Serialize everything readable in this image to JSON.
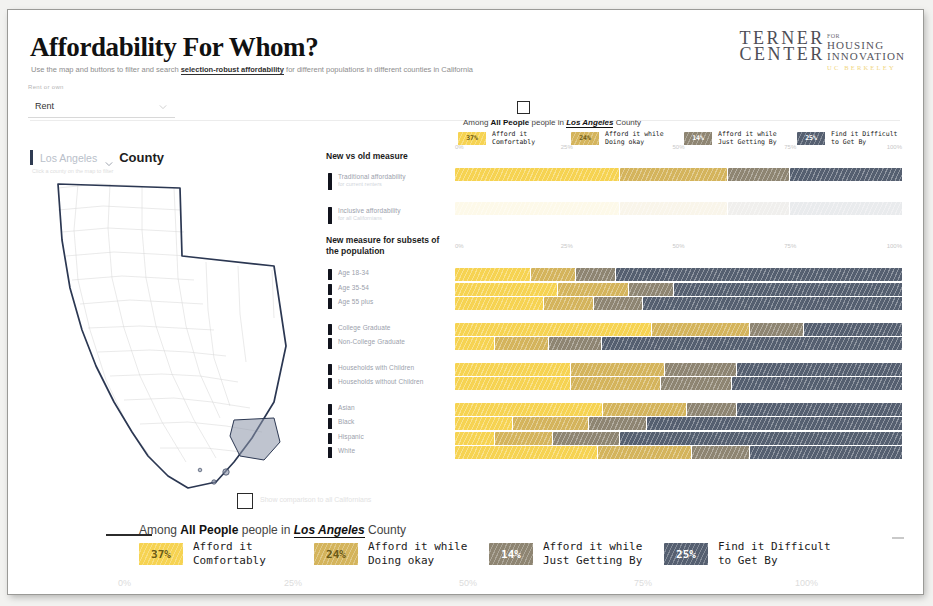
{
  "header": {
    "title": "Affordability For Whom?",
    "subtitle_pre": "Use the map and buttons to filter and search ",
    "subtitle_link": "selection-robust affordability",
    "subtitle_post": " for different populations in different counties in California",
    "logo": {
      "line1": "TERNER",
      "line2": "CENTER",
      "for": "FOR",
      "housing": "HOUSING",
      "innovation": "INNOVATION",
      "uc": "UC BERKELEY"
    }
  },
  "tenure_control": {
    "label": "Rent or own",
    "value": "Rent",
    "chevron": "chevron-down-icon"
  },
  "map": {
    "county_value": "Los Angeles",
    "county_suffix": "County",
    "chevron": "chevron-down-icon",
    "hint": "Click a county on the map to filter",
    "selected": "Los Angeles"
  },
  "controls": {
    "group1_title": "New vs old measure",
    "group1_items": [
      {
        "label": "Traditional affordability",
        "sub": "for current renters"
      },
      {
        "label": "Inclusive affordability",
        "sub": "for all Californians"
      }
    ],
    "group2_title": "New measure for subsets of the population",
    "group2_items": [
      {
        "label": "Age 18-34"
      },
      {
        "label": "Age 35-54"
      },
      {
        "label": "Age 55 plus"
      },
      {
        "label": "College Graduate"
      },
      {
        "label": "Non-College Graduate"
      },
      {
        "label": "Households with Children"
      },
      {
        "label": "Households without Children"
      },
      {
        "label": "Asian"
      },
      {
        "label": "Black"
      },
      {
        "label": "Hispanic"
      },
      {
        "label": "White"
      }
    ]
  },
  "legend": {
    "title_pre": "Among ",
    "title_bold": "All People",
    "title_mid": " people in ",
    "title_italic": "Los Angeles",
    "title_post": " County",
    "items": [
      {
        "pct": "37%",
        "line1": "Afford it",
        "line2": "Comfortably",
        "color": "#f6d352"
      },
      {
        "pct": "24%",
        "line1": "Afford it while",
        "line2": "Doing okay",
        "color": "#d4b45c"
      },
      {
        "pct": "14%",
        "line1": "Afford it while",
        "line2": "Just Getting By",
        "color": "#8e8572"
      },
      {
        "pct": "25%",
        "line1": "Find it Difficult",
        "line2": "to Get By",
        "color": "#555f70"
      }
    ]
  },
  "checkbox_top": {
    "name": "top-checkbox",
    "checked": false
  },
  "checkbox_bottom": {
    "name": "bottom-checkbox",
    "checked": false,
    "note": "Show comparison to all Californians"
  },
  "chart_data": {
    "type": "bar",
    "orientation": "horizontal",
    "stacked": true,
    "title": "Among All People people in Los Angeles County",
    "xlabel": "",
    "ylabel": "",
    "xlim": [
      0,
      100
    ],
    "xticks": [
      "0%",
      "25%",
      "50%",
      "75%",
      "100%"
    ],
    "xtick_values": [
      0,
      25,
      50,
      75,
      100
    ],
    "grid": false,
    "legend_position": "top",
    "series": [
      {
        "name": "Afford it Comfortably",
        "color": "#f6d352"
      },
      {
        "name": "Afford it while Doing okay",
        "color": "#d4b45c"
      },
      {
        "name": "Afford it while Just Getting By",
        "color": "#8e8572"
      },
      {
        "name": "Find it Difficult to Get By",
        "color": "#555f70"
      }
    ],
    "panels": [
      {
        "name": "New vs old measure",
        "categories": [
          "Traditional affordability",
          "Inclusive affordability"
        ],
        "values": [
          [
            37,
            24,
            14,
            25
          ],
          [
            37,
            24,
            14,
            25
          ]
        ],
        "faded": [
          false,
          true
        ]
      },
      {
        "name": "New measure for subsets of the population",
        "categories": [
          "Age 18-34",
          "Age 35-54",
          "Age 55 plus",
          "College Graduate",
          "Non-College Graduate",
          "Households with Children",
          "Households without Children",
          "Asian",
          "Black",
          "Hispanic",
          "White"
        ],
        "values": [
          [
            17,
            10,
            9,
            64
          ],
          [
            23,
            16,
            10,
            51
          ],
          [
            20,
            11,
            11,
            58
          ],
          [
            44,
            22,
            12,
            22
          ],
          [
            9,
            12,
            12,
            67
          ],
          [
            26,
            21,
            16,
            37
          ],
          [
            26,
            20,
            16,
            38
          ],
          [
            33,
            19,
            11,
            37
          ],
          [
            13,
            17,
            13,
            57
          ],
          [
            9,
            13,
            15,
            63
          ],
          [
            32,
            21,
            13,
            34
          ]
        ],
        "gaps_after": [
          2,
          4,
          6
        ]
      }
    ]
  }
}
